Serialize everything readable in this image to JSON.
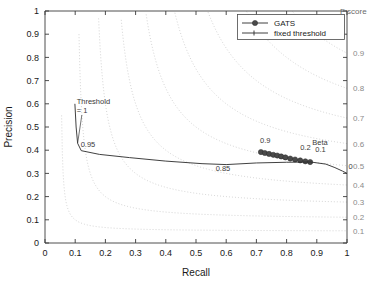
{
  "chart_data": {
    "type": "line",
    "title": "",
    "xlabel": "Recall",
    "ylabel": "Precision",
    "xlim": [
      0,
      1
    ],
    "ylim": [
      0,
      1
    ],
    "xticks": [
      "0",
      "0.1",
      "0.2",
      "0.3",
      "0.4",
      "0.5",
      "0.6",
      "0.7",
      "0.8",
      "0.9",
      "1"
    ],
    "yticks": [
      "0",
      "0.1",
      "0.2",
      "0.3",
      "0.4",
      "0.5",
      "0.6",
      "0.7",
      "0.8",
      "0.9",
      "1"
    ],
    "grid": false,
    "legend_position": "top-right",
    "legend": [
      {
        "label": "GATS",
        "style": "line-with-marker"
      },
      {
        "label": "fixed threshold",
        "style": "line"
      }
    ],
    "secondary_axis": {
      "title": "F score",
      "labels": [
        "0.9",
        "0.8",
        "0.7",
        "0.6",
        "0.5",
        "0.4",
        "0.3",
        "0.2",
        "0.1"
      ],
      "values": [
        0.9,
        0.8,
        0.7,
        0.6,
        0.5,
        0.4,
        0.3,
        0.2,
        0.1
      ]
    },
    "iso_f_contours": [
      0.9,
      0.8,
      0.7,
      0.6,
      0.5,
      0.4,
      0.3,
      0.2,
      0.1
    ],
    "series": [
      {
        "name": "GATS",
        "points": [
          {
            "x": 0.715,
            "y": 0.392
          },
          {
            "x": 0.728,
            "y": 0.388
          },
          {
            "x": 0.742,
            "y": 0.384
          },
          {
            "x": 0.756,
            "y": 0.38
          },
          {
            "x": 0.769,
            "y": 0.377
          },
          {
            "x": 0.782,
            "y": 0.373
          },
          {
            "x": 0.796,
            "y": 0.369
          },
          {
            "x": 0.812,
            "y": 0.364
          },
          {
            "x": 0.828,
            "y": 0.36
          },
          {
            "x": 0.845,
            "y": 0.356
          },
          {
            "x": 0.862,
            "y": 0.352
          },
          {
            "x": 0.878,
            "y": 0.349
          }
        ],
        "annotations": [
          {
            "text": "0.9",
            "x": 0.712,
            "y": 0.432
          },
          {
            "text": "0.2",
            "x": 0.845,
            "y": 0.4
          },
          {
            "text": "Beta",
            "x": 0.885,
            "y": 0.424
          },
          {
            "text": "0.1",
            "x": 0.895,
            "y": 0.392
          }
        ]
      },
      {
        "name": "fixed threshold",
        "points": [
          {
            "x": 0.099,
            "y": 0.6
          },
          {
            "x": 0.103,
            "y": 0.5
          },
          {
            "x": 0.108,
            "y": 0.43
          },
          {
            "x": 0.12,
            "y": 0.398
          },
          {
            "x": 0.18,
            "y": 0.382
          },
          {
            "x": 0.28,
            "y": 0.368
          },
          {
            "x": 0.4,
            "y": 0.353
          },
          {
            "x": 0.52,
            "y": 0.342
          },
          {
            "x": 0.6,
            "y": 0.338
          },
          {
            "x": 0.7,
            "y": 0.345
          },
          {
            "x": 0.8,
            "y": 0.348
          },
          {
            "x": 0.88,
            "y": 0.349
          },
          {
            "x": 0.93,
            "y": 0.34
          },
          {
            "x": 0.96,
            "y": 0.325
          },
          {
            "x": 0.985,
            "y": 0.31
          },
          {
            "x": 1.0,
            "y": 0.3
          }
        ],
        "annotations": [
          {
            "text": "Threshold",
            "x": 0.105,
            "y": 0.6
          },
          {
            "text": "= 1",
            "x": 0.105,
            "y": 0.56
          },
          {
            "text": "0.95",
            "x": 0.118,
            "y": 0.412
          },
          {
            "text": "0.85",
            "x": 0.565,
            "y": 0.31
          },
          {
            "text": "0",
            "x": 1.005,
            "y": 0.318
          }
        ]
      }
    ]
  }
}
